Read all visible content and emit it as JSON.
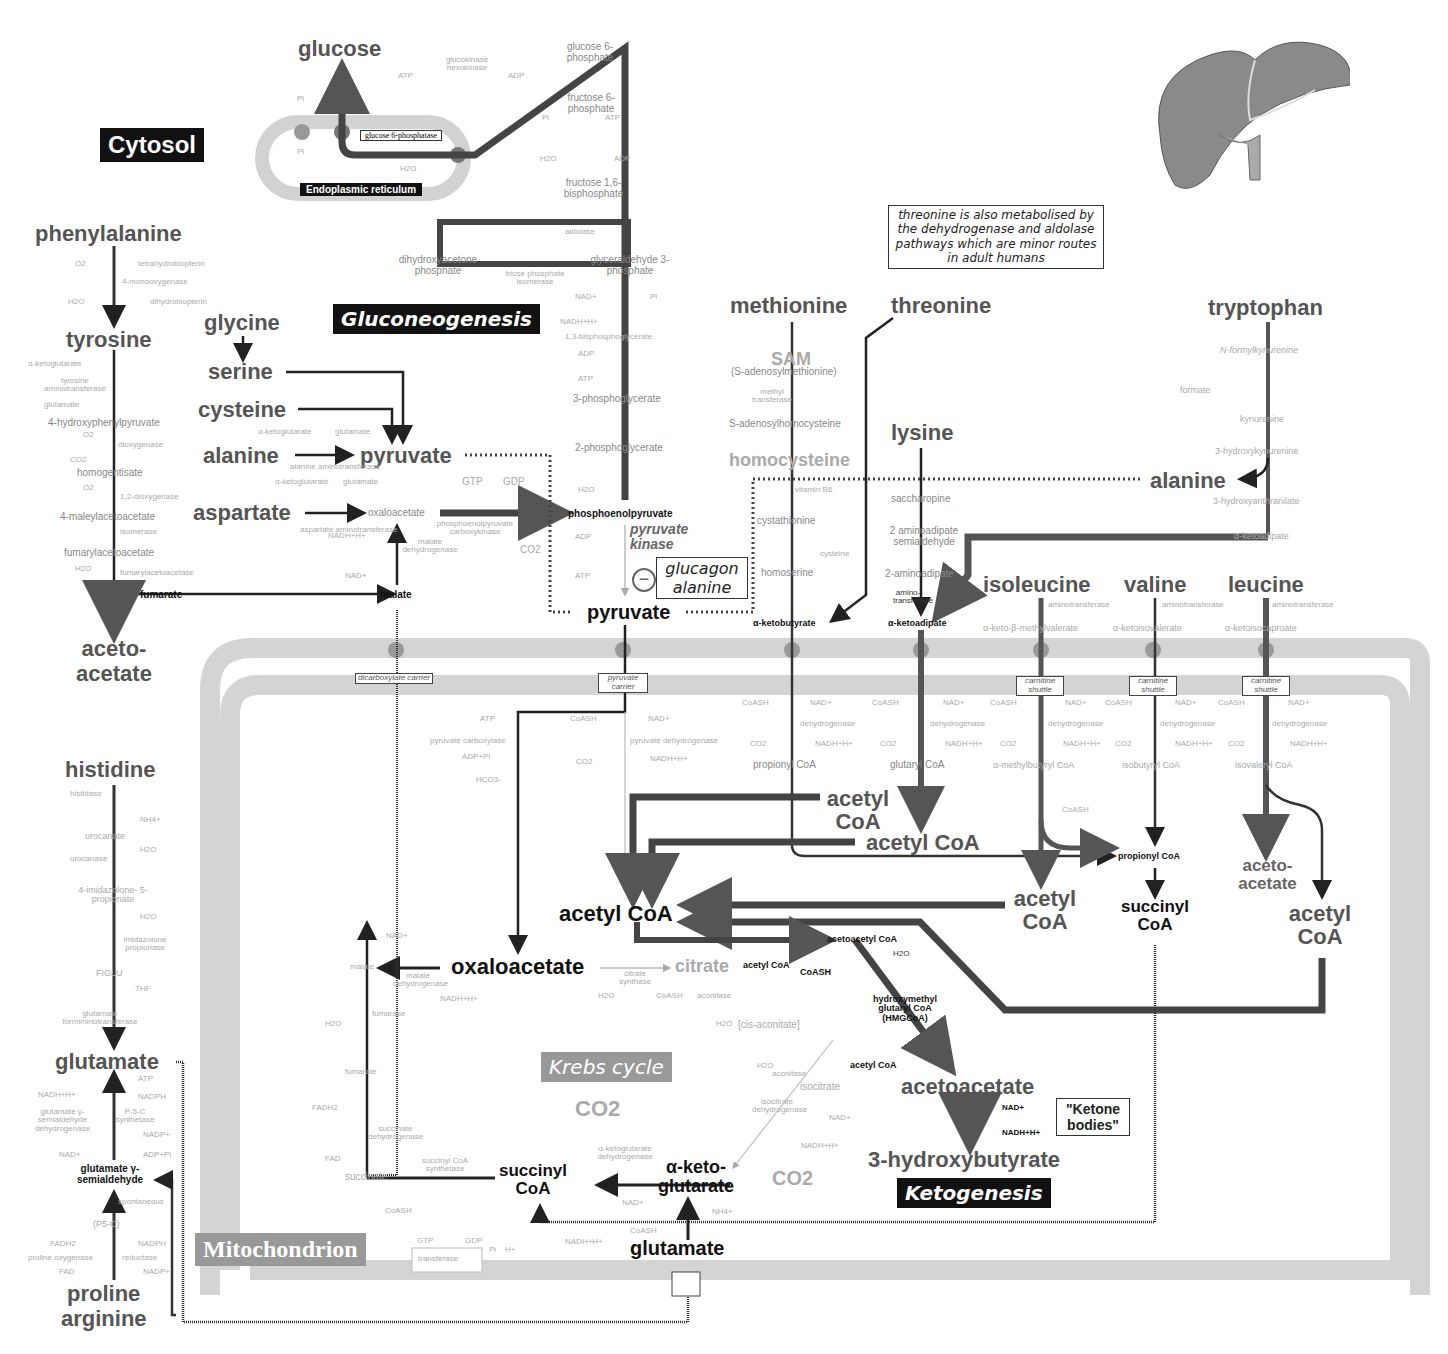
{
  "compartments": {
    "cytosol": "Cytosol",
    "endoplasmic_reticulum": "Endoplasmic reticulum",
    "mitochondrion": "Mitochondrion"
  },
  "pathways": {
    "gluconeogenesis": "Gluconeogenesis",
    "krebs": "Krebs cycle",
    "ketogenesis": "Ketogenesis"
  },
  "gluconeogenesis": {
    "glucose": "glucose",
    "atp": "ATP",
    "adp": "ADP",
    "hexokinase": "glucokinase hexokinase",
    "g6p": "glucose 6-phosphate",
    "g6pase": "glucose 6-phosphatase",
    "pi_top": "Pi",
    "pi_er": "Pi",
    "h2o_er": "H2O",
    "f6p": "fructose 6-phosphate",
    "pi_f": "Pi",
    "atp_f": "ATP",
    "h2o_f": "H2O",
    "adp_f": "ADP",
    "f16bp": "fructose 1,6-bisphosphate",
    "aldolase": "aldolase",
    "dhap": "dihydroxyacetone phosphate",
    "tpi": "triose phosphate isomerase",
    "gap": "glyceraldehyde 3-phosphate",
    "nad": "NAD+",
    "pi_g": "Pi",
    "nadh": "NADH+H+",
    "bpg": "1,3-bisphosphoglycerate",
    "adp_g": "ADP",
    "atp_g": "ATP",
    "pg3": "3-phosphoglycerate",
    "pg2": "2-phosphoglycerate",
    "h2o_g": "H2O",
    "pep": "phosphoenolpyruvate",
    "pk": "pyruvate kinase",
    "adp_pk": "ADP",
    "atp_pk": "ATP",
    "inhibitor_symbol": "−",
    "inhibitors": [
      "glucagon",
      "alanine"
    ],
    "pyruvate_cyt": "pyruvate",
    "gtp": "GTP",
    "gdp": "GDP",
    "pepck": "phosphoenolpyruvate carboxykinase",
    "co2": "CO2"
  },
  "left_amino": {
    "phenylalanine": "phenylalanine",
    "o2": "O2",
    "thb": "tetrahydrobiopterin",
    "pah": "4-monooxygenase",
    "h2o": "H2O",
    "dhb": "dihydrobiopterin",
    "tyrosine": "tyrosine",
    "akg": "α-ketoglutarate",
    "tat": "tyrosine aminotransferase",
    "glutamate": "glutamate",
    "hpp": "4-hydroxyphenylpyruvate",
    "o2b": "O2",
    "dioxygenase": "dioxygenase",
    "co2": "CO2",
    "homogentisate": "homogentisate",
    "o2c": "O2",
    "dioxygenase2": "1,2-dioxygenase",
    "maa": "4-maleylacetoacetate",
    "isomerase": "isomerase",
    "faa": "fumarylacetoacetate",
    "h2ob": "H2O",
    "hydrolase": "fumarylacetoacetase",
    "fumarate": "fumarate",
    "acetoacetate": "aceto- acetate"
  },
  "center_amino": {
    "glycine": "glycine",
    "serine": "serine",
    "cysteine": "cysteine",
    "alanine": "alanine",
    "pyruvate": "pyruvate",
    "akg1": "α-ketoglutarate",
    "glu1": "glutamate",
    "alt": "alanine aminotransferase",
    "aspartate": "aspartate",
    "akg2": "α-ketoglutarate",
    "glu2": "glutamate",
    "ast": "aspartate aminotransferase",
    "oaa": "oxaloacetate",
    "nadh": "NADH+H+",
    "mdh": "malate dehydrogenase",
    "nad": "NAD+",
    "malate": "malate"
  },
  "right_amino": {
    "note": "threonine is also metabolised by the dehydrogenase and aldolase pathways which are minor routes in adult humans",
    "methionine": "methionine",
    "threonine": "threonine",
    "sam": "SAM",
    "sam_full": "(S-adenosylmethionine)",
    "methyltransferase": "methyl transferase",
    "sah": "S-adenosylhomocysteine",
    "homocysteine": "homocysteine",
    "b6": "vitamin B6",
    "cystathionine": "cystathionine",
    "cysteine": "cysteine",
    "homoserine": "homoserine",
    "akb": "α-ketobutyrate",
    "lysine": "lysine",
    "saccharopine": "saccharopine",
    "aas": "2 aminoadipate semialdehyde",
    "aa": "2-aminoadipate",
    "aminotransferase": "amino- transferase",
    "aka": "α-ketoadipate",
    "tryptophan": "tryptophan",
    "nfk": "N-formylkynurenine",
    "formate": "formate",
    "kynurenine": "kynurenine",
    "hk": "3-hydroxykynurenine",
    "alanine": "alanine",
    "haa": "3-hydroxyanthranilate",
    "aka2": "α-ketoadipate"
  },
  "bcaa": {
    "isoleucine": "isoleucine",
    "valine": "valine",
    "leucine": "leucine",
    "ile_aminotransferase": "aminotransferase",
    "val_aminotransferase": "aminotransferase",
    "leu_aminotransferase": "aminotransferase",
    "kmv": "α-keto-β-methylvalerate",
    "kiv": "α-ketoisovalerate",
    "kic": "α-ketoisocaproate",
    "carnitine": "carnitine shuttle",
    "coash": "CoASH",
    "nad": "NAD+",
    "dehydrogenase": "dehydrogenase",
    "co2": "CO2",
    "nadh": "NADH+H+",
    "mbcoa": "α-methylbutyryl CoA",
    "ibcoa": "isobutyryl CoA",
    "ivcoa": "isovaleryl CoA",
    "coash2": "CoASH",
    "propionyl": "propionyl CoA",
    "succinyl": "succinyl CoA",
    "acetyl_ile": "acetyl CoA",
    "acetoacetate_leu": "aceto- acetate",
    "acetyl_leu": "acetyl CoA"
  },
  "mito": {
    "dicarboxylate": "dicarboxylate carrier",
    "pyruvate_carrier": "pyruvate carrier",
    "atp": "ATP",
    "pc": "pyruvate carboxylase",
    "adp": "ADP+Pi",
    "hco3": "HCO3-",
    "coash": "CoASH",
    "nad": "NAD+",
    "pdh": "pyruvate dehydrogenase",
    "co2": "CO2",
    "nadh": "NADH+H+",
    "met_coash": "CoASH",
    "met_nad": "NAD+",
    "met_dh": "dehydrogenase",
    "met_co2": "CO2",
    "met_nadh": "NADH+H+",
    "propionyl_met": "propionyl CoA",
    "lys_coash": "CoASH",
    "lys_nad": "NAD+",
    "lys_dh": "dehydrogenase",
    "lys_co2": "CO2",
    "lys_nadh": "NADH+H+",
    "glutaryl": "glutaryl CoA",
    "acetyl_a": "acetyl CoA",
    "acetyl_b": "acetyl CoA",
    "acetyl_main": "acetyl CoA",
    "acetoacetyl": "acetoacetyl CoA",
    "acetyl_small": "acetyl CoA",
    "coash_small": "CoASH",
    "h2o_hmg": "H2O",
    "hmg": "hydroxymethyl glutaryl CoA (HMGCoA)",
    "acetyl_hmg": "acetyl CoA",
    "acetoacetate": "acetoacetate",
    "nad_k": "NAD+",
    "nadh_k": "NADH+H+",
    "hb": "3-hydroxybutyrate",
    "ketone": "\"Ketone bodies\""
  },
  "krebs": {
    "oxaloacetate": "oxaloacetate",
    "citrate": "citrate",
    "cs": "citrate synthase",
    "h2o_cs": "H2O",
    "coash_cs": "CoASH",
    "aconitase": "aconitase",
    "h2o_a": "H2O",
    "cis": "[cis-aconitate]",
    "h2o_b": "H2O",
    "aconitase2": "aconitase",
    "isocitrate": "isocitrate",
    "idh": "isocitrate dehydrogenase",
    "nad_i": "NAD+",
    "nadh_i": "NADH+H+",
    "co2_i": "CO2",
    "akg": "α-keto- glutarate",
    "akgdh": "α-ketoglutarate dehydrogenase",
    "nad_k": "NAD+",
    "coash_k": "CoASH",
    "nadh_k": "NADH+H+",
    "co2_k": "CO2",
    "nh4": "NH4+",
    "glutamate": "glutamate",
    "succinyl": "succinyl CoA",
    "scs": "succinyl CoA synthetase",
    "coash_s": "CoASH",
    "gtp": "GTP",
    "gdp": "GDP",
    "pi": "Pi",
    "h": "H+",
    "nucleotide": "transferase",
    "succinate": "succinate",
    "fad": "FAD",
    "sdh": "succinate dehydrogenase",
    "fadh2": "FADH2",
    "fumarate": "fumarate",
    "h2o_f": "H2O",
    "fumarase": "fumarase",
    "malate": "malate",
    "mdh": "malate dehydrogenase",
    "nad_m": "NAD+",
    "nadh_m": "NADH+H+"
  },
  "bottom_left": {
    "histidine": "histidine",
    "histidase": "histidase",
    "nh4": "NH4+",
    "urocanate": "urocanate",
    "urocanase": "urocanase",
    "h2o": "H2O",
    "imid": "4-imidazolone- 5-propionate",
    "h2ob": "H2O",
    "ip": "imidazolone propionase",
    "figlu": "FIGLU",
    "thf": "THF",
    "gft": "glutamate formiminotransferase",
    "glutamate": "glutamate",
    "atp": "ATP",
    "nadph": "NADPH",
    "nadh": "NADH+H+",
    "p5cs": "P-5-C synthetase",
    "gsdh": "glutamate γ-semialdehyde dehydrogenase",
    "nadp": "NADP+",
    "nad": "NAD+",
    "adppi": "ADP+Pi",
    "gsa": "glutamate γ-semialdehyde",
    "spontaneous": "spontaneous",
    "p5c": "(P5-C)",
    "fadh2": "FADH2",
    "nadph2": "NADPH",
    "pod": "proline oxygenase",
    "p5cr": "reductase",
    "fad": "FAD",
    "nadp2": "NADP+",
    "proline": "proline",
    "arginine": "arginine"
  },
  "illustration": "liver-illustration"
}
